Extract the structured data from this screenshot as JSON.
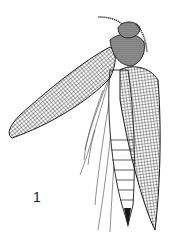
{
  "figure": {
    "label": "1",
    "style": "black ink line drawing with reticulate cell pattern on wings",
    "colors": {
      "ink": "#1a1a1a",
      "shade": "#6a6a6a",
      "background": "#ffffff"
    }
  }
}
